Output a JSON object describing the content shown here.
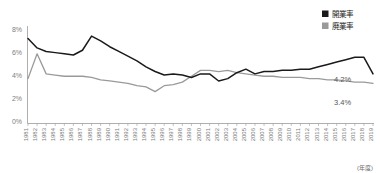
{
  "chart_data": {
    "type": "line",
    "title": "",
    "xlabel": "(年度)",
    "ylabel": "",
    "ylim": [
      0,
      8
    ],
    "yticks": [
      "0%",
      "2%",
      "4%",
      "6%",
      "8%"
    ],
    "ytick_values": [
      0,
      2,
      4,
      6,
      8
    ],
    "grid": false,
    "legend_position": "top-right",
    "categories": [
      "1981",
      "1982",
      "1983",
      "1984",
      "1985",
      "1986",
      "1987",
      "1988",
      "1989",
      "1990",
      "1991",
      "1992",
      "1993",
      "1994",
      "1995",
      "1996",
      "1997",
      "1998",
      "1999",
      "2000",
      "2001",
      "2002",
      "2003",
      "2004",
      "2005",
      "2006",
      "2007",
      "2008",
      "2009",
      "2010",
      "2011",
      "2012",
      "2013",
      "2014",
      "2015",
      "2016",
      "2017",
      "2018",
      "2019"
    ],
    "series": [
      {
        "name": "開業率",
        "color": "#1a1a1a",
        "values": [
          7.2,
          6.4,
          6.1,
          6.0,
          5.9,
          5.8,
          6.2,
          7.4,
          7.0,
          6.5,
          6.1,
          5.7,
          5.3,
          4.8,
          4.4,
          4.1,
          4.2,
          4.1,
          3.9,
          4.2,
          4.2,
          3.6,
          3.8,
          4.3,
          4.6,
          4.2,
          4.4,
          4.4,
          4.5,
          4.5,
          4.6,
          4.6,
          4.8,
          5.0,
          5.2,
          5.4,
          5.6,
          5.6,
          4.2
        ]
      },
      {
        "name": "廃業率",
        "color": "#9a9a9a",
        "values": [
          3.8,
          5.9,
          4.2,
          4.1,
          4.0,
          4.0,
          4.0,
          3.9,
          3.7,
          3.6,
          3.5,
          3.4,
          3.2,
          3.1,
          2.7,
          3.2,
          3.3,
          3.5,
          4.0,
          4.5,
          4.5,
          4.4,
          4.5,
          4.3,
          4.2,
          4.1,
          4.0,
          4.0,
          3.9,
          3.9,
          3.9,
          3.8,
          3.8,
          3.7,
          3.7,
          3.6,
          3.5,
          3.5,
          3.4
        ]
      }
    ],
    "annotations": [
      {
        "text": "4.2%",
        "series": "開業率",
        "value": 4.2
      },
      {
        "text": "3.4%",
        "series": "廃業率",
        "value": 3.4
      }
    ]
  },
  "legend": {
    "items": [
      {
        "label": "開業率",
        "color": "#1a1a1a"
      },
      {
        "label": "廃業率",
        "color": "#9a9a9a"
      }
    ]
  },
  "axis": {
    "y_labels": [
      "8%",
      "6%",
      "4%",
      "2%",
      "0%"
    ],
    "x_unit": "(年度)"
  }
}
